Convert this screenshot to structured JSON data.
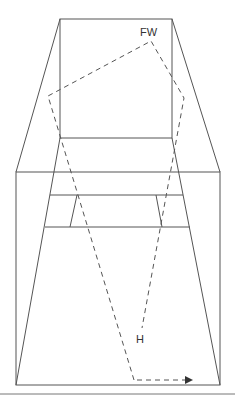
{
  "diagram": {
    "title": "",
    "labels": {
      "fw": "FW",
      "h": "H"
    },
    "colors": {
      "line": "#555555",
      "text": "#333333",
      "background": "#ffffff"
    }
  }
}
